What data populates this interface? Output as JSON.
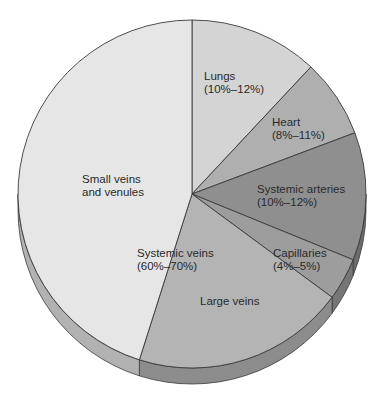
{
  "chart_data": {
    "type": "pie",
    "title": "",
    "style": "3d-pie",
    "center": [
      192,
      194
    ],
    "radius": 174,
    "depth": 16,
    "slices": [
      {
        "name": "Lungs",
        "range": "10%–12%",
        "start_deg": -90,
        "end_deg": -46.9,
        "fill": "#d4d4d4",
        "side": "#b5b5b5"
      },
      {
        "name": "Heart",
        "range": "8%–11%",
        "start_deg": -46.9,
        "end_deg": -20.6,
        "fill": "#afafaf",
        "side": "#8e8e8e"
      },
      {
        "name": "Systemic arteries",
        "range": "10%–12%",
        "start_deg": -20.6,
        "end_deg": 22.2,
        "fill": "#8f8f8f",
        "side": "#6c6c6c"
      },
      {
        "name": "Capillaries",
        "range": "4%–5%",
        "start_deg": 22.2,
        "end_deg": 36.4,
        "fill": "#9d9d9d",
        "side": "#767676"
      },
      {
        "name": "Large veins",
        "range": "",
        "start_deg": 36.4,
        "end_deg": 107.6,
        "fill": "#b4b4b4",
        "side": "#8c8c8c",
        "group": "Systemic veins"
      },
      {
        "name": "Small veins and venules",
        "range": "",
        "start_deg": 107.6,
        "end_deg": 270,
        "fill": "#e6e6e6",
        "side": "#b2b2b2",
        "group": "Systemic veins"
      }
    ],
    "groups": [
      {
        "name": "Systemic veins",
        "range": "60%–70%",
        "members": [
          "Large veins",
          "Small veins and venules"
        ]
      }
    ],
    "legend": "none (inline labels)",
    "stroke": "#3a3a3a"
  },
  "labels": {
    "lungs": {
      "line1": "Lungs",
      "line2": "(10%–12%)"
    },
    "heart": {
      "line1": "Heart",
      "line2": "(8%–11%)"
    },
    "arteries": {
      "line1": "Systemic arteries",
      "line2": "(10%–12%)"
    },
    "capillaries": {
      "line1": "Capillaries",
      "line2": "(4%–5%)"
    },
    "systemic_veins": {
      "line1": "Systemic veins",
      "line2": "(60%–70%)"
    },
    "small_veins": {
      "line1": "Small veins",
      "line2": "and venules"
    },
    "large_veins": {
      "line1": "Large veins"
    }
  }
}
